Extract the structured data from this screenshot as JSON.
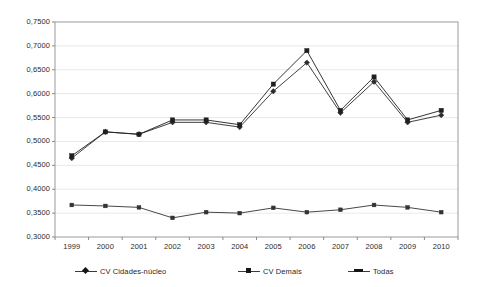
{
  "chart_data": {
    "type": "line",
    "title": "",
    "subtitle": "",
    "xlabel": "",
    "ylabel": "",
    "categories": [
      "1999",
      "2000",
      "2001",
      "2002",
      "2003",
      "2004",
      "2005",
      "2006",
      "2007",
      "2008",
      "2009",
      "2010"
    ],
    "x": [
      1999,
      2000,
      2001,
      2002,
      2003,
      2004,
      2005,
      2006,
      2007,
      2008,
      2009,
      2010
    ],
    "ylim": [
      0.3,
      0.75
    ],
    "ytick_step": 0.05,
    "ytick_labels": [
      "0,3000",
      "0,3500",
      "0,4000",
      "0,4500",
      "0,5000",
      "0,5500",
      "0,6000",
      "0,6500",
      "0,7000",
      "0,7500"
    ],
    "ytick_values": [
      0.3,
      0.35,
      0.4,
      0.45,
      0.5,
      0.55,
      0.6,
      0.65,
      0.7,
      0.75
    ],
    "grid": true,
    "grid_axis": "y",
    "legend_position": "bottom",
    "series": [
      {
        "name": "CV Cidades-núcleo",
        "marker": "diamond",
        "color": "#2b2b2b",
        "values": [
          0.465,
          0.52,
          0.515,
          0.54,
          0.54,
          0.53,
          0.605,
          0.665,
          0.56,
          0.625,
          0.54,
          0.555
        ]
      },
      {
        "name": "CV Demais",
        "marker": "square",
        "color": "#1f1f1f",
        "values": [
          0.47,
          0.52,
          0.515,
          0.545,
          0.545,
          0.535,
          0.62,
          0.69,
          0.565,
          0.635,
          0.545,
          0.565
        ]
      },
      {
        "name": "Todas",
        "marker": "dot",
        "color": "#333333",
        "values": [
          0.367,
          0.365,
          0.362,
          0.34,
          0.352,
          0.35,
          0.361,
          0.352,
          0.357,
          0.367,
          0.362,
          0.352
        ]
      }
    ]
  },
  "legend": {
    "items": [
      {
        "label": "CV Cidades-núcleo",
        "key": "diamond"
      },
      {
        "label": "CV Demais",
        "key": "square"
      },
      {
        "label": "Todas",
        "key": "plain"
      }
    ]
  }
}
